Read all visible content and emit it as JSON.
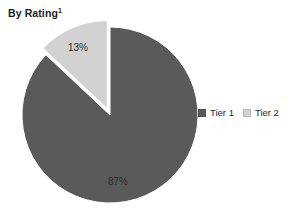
{
  "title": {
    "text": "By Rating",
    "footnote_marker": "1"
  },
  "colors": {
    "background": "#ffffff",
    "tier1": "#5a5a5a",
    "tier2": "#d2d2d2",
    "label_on_light": "#2b2b2b",
    "label_on_dark": "#2e2e2e",
    "title": "#1c1c1c"
  },
  "legend": {
    "position": "right",
    "items": [
      {
        "label": "Tier 1",
        "color": "#5a5a5a",
        "swatch_name": "legend-swatch-tier-1"
      },
      {
        "label": "Tier 2",
        "color": "#d2d2d2",
        "swatch_name": "legend-swatch-tier-2"
      }
    ]
  },
  "chart_data": {
    "type": "pie",
    "title": "By Rating",
    "xlabel": "",
    "ylabel": "",
    "categories": [
      "Tier 1",
      "Tier 2"
    ],
    "values": [
      87,
      13
    ],
    "value_unit": "percent",
    "data_labels": [
      "87%",
      "13%"
    ],
    "colors": [
      "#5a5a5a",
      "#d2d2d2"
    ],
    "start_angle_deg": 0,
    "direction": "clockwise",
    "exploded_slices": [
      "Tier 2"
    ],
    "legend_position": "right",
    "grid": false,
    "slices": [
      {
        "name": "Tier 1",
        "value": 87,
        "label": "87%",
        "color": "#5a5a5a",
        "exploded": false,
        "label_x": 118,
        "label_y": 182
      },
      {
        "name": "Tier 2",
        "value": 13,
        "label": "13%",
        "color": "#d2d2d2",
        "exploded": true,
        "label_x": 78,
        "label_y": 48
      }
    ]
  },
  "geometry": {
    "center_x": 110,
    "center_y": 115,
    "radius": 88,
    "explode_offset": 7
  }
}
